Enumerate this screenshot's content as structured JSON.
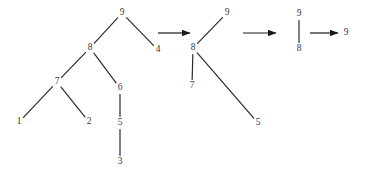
{
  "figure": {
    "type": "tree-transformation-sequence",
    "background_color": "#ffffff",
    "edge_color": "#2b2b2b",
    "label_color": "#3a3a3a",
    "arrow_color": "#1a1a1a",
    "panel_count": 4,
    "arrow_count": 3
  },
  "trees": [
    {
      "id": "tree-1",
      "nodes": [
        {
          "id": "t1-n9",
          "label": "9",
          "x": 122,
          "y": 13
        },
        {
          "id": "t1-n8",
          "label": "8",
          "x": 90,
          "y": 48
        },
        {
          "id": "t1-n4",
          "label": "4",
          "x": 158,
          "y": 50
        },
        {
          "id": "t1-n7",
          "label": "7",
          "x": 57,
          "y": 82
        },
        {
          "id": "t1-n6",
          "label": "6",
          "x": 120,
          "y": 88
        },
        {
          "id": "t1-n1",
          "label": "1",
          "x": 19,
          "y": 122
        },
        {
          "id": "t1-n2",
          "label": "2",
          "x": 89,
          "y": 122
        },
        {
          "id": "t1-n5",
          "label": "5",
          "x": 120,
          "y": 123
        },
        {
          "id": "t1-n3",
          "label": "3",
          "x": 120,
          "y": 162
        }
      ],
      "edges": [
        {
          "from": "t1-n9",
          "to": "t1-n8"
        },
        {
          "from": "t1-n9",
          "to": "t1-n4"
        },
        {
          "from": "t1-n8",
          "to": "t1-n7"
        },
        {
          "from": "t1-n8",
          "to": "t1-n6"
        },
        {
          "from": "t1-n7",
          "to": "t1-n1"
        },
        {
          "from": "t1-n7",
          "to": "t1-n2"
        },
        {
          "from": "t1-n6",
          "to": "t1-n5"
        },
        {
          "from": "t1-n5",
          "to": "t1-n3"
        }
      ]
    },
    {
      "id": "tree-2",
      "nodes": [
        {
          "id": "t2-n9",
          "label": "9",
          "x": 227,
          "y": 13
        },
        {
          "id": "t2-n8",
          "label": "8",
          "x": 193,
          "y": 48
        },
        {
          "id": "t2-n7",
          "label": "7",
          "x": 192,
          "y": 86
        },
        {
          "id": "t2-n5",
          "label": "5",
          "x": 258,
          "y": 123
        }
      ],
      "edges": [
        {
          "from": "t2-n8",
          "to": "t2-n9"
        },
        {
          "from": "t2-n8",
          "to": "t2-n7"
        },
        {
          "from": "t2-n8",
          "to": "t2-n5"
        }
      ]
    },
    {
      "id": "tree-3",
      "nodes": [
        {
          "id": "t3-n9",
          "label": "9",
          "x": 299,
          "y": 14
        },
        {
          "id": "t3-n8",
          "label": "8",
          "x": 299,
          "y": 49
        }
      ],
      "edges": [
        {
          "from": "t3-n9",
          "to": "t3-n8"
        }
      ]
    },
    {
      "id": "tree-4",
      "nodes": [
        {
          "id": "t4-n9",
          "label": "9",
          "x": 346,
          "y": 33
        }
      ],
      "edges": []
    }
  ],
  "arrows": [
    {
      "id": "arrow-1",
      "x1": 158,
      "y1": 33,
      "x2": 190,
      "y2": 33
    },
    {
      "id": "arrow-2",
      "x1": 243,
      "y1": 33,
      "x2": 276,
      "y2": 33
    },
    {
      "id": "arrow-3",
      "x1": 310,
      "y1": 33,
      "x2": 338,
      "y2": 33
    }
  ]
}
